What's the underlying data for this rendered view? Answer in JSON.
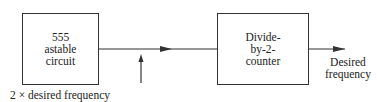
{
  "blocks": {
    "astable": {
      "label": "555\nastable\ncircuit"
    },
    "divider": {
      "label": "Divide-\nby-2-\ncounter"
    }
  },
  "labels": {
    "input_signal": "2 × desired frequency",
    "output": "Desired\nfrequency"
  },
  "colors": {
    "stroke": "#333333",
    "background": "#ffffff"
  }
}
